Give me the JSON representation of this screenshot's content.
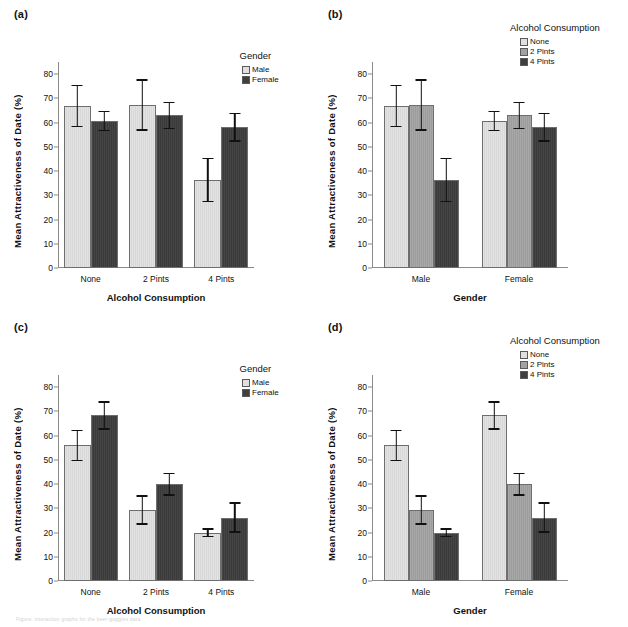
{
  "figure": {
    "caption_fragment": "Figure: interaction graphs for the beer-goggles data"
  },
  "axis": {
    "y_label": "Mean Attractiveness of Date (%)",
    "y_ticks": [
      "0",
      "10",
      "20",
      "30",
      "40",
      "50",
      "60",
      "70",
      "80"
    ],
    "y_min": 0,
    "y_max": 85
  },
  "colors": {
    "bar_none": "#dcdcdc",
    "bar_2pints": "#a2a2a2",
    "bar_4pints": "#3f3f3f",
    "bar_male": "#dcdcdc",
    "bar_female": "#3f3f3f",
    "axis": "#8a8a8a",
    "text": "#111111"
  },
  "panels": [
    {
      "id": "a",
      "label": "(a)",
      "x_label": "Alcohol Consumption",
      "legend_title": "Gender",
      "legend_items": [
        {
          "label": "Male",
          "key": "male"
        },
        {
          "label": "Female",
          "key": "female"
        }
      ]
    },
    {
      "id": "b",
      "label": "(b)",
      "x_label": "Gender",
      "legend_title": "Alcohol Consumption",
      "legend_items": [
        {
          "label": "None",
          "key": "none"
        },
        {
          "label": "2 Pints",
          "key": "two"
        },
        {
          "label": "4 Pints",
          "key": "four"
        }
      ]
    },
    {
      "id": "c",
      "label": "(c)",
      "x_label": "Alcohol Consumption",
      "legend_title": "Gender",
      "legend_items": [
        {
          "label": "Male",
          "key": "male"
        },
        {
          "label": "Female",
          "key": "female"
        }
      ]
    },
    {
      "id": "d",
      "label": "(d)",
      "x_label": "Gender",
      "legend_title": "Alcohol Consumption",
      "legend_items": [
        {
          "label": "None",
          "key": "none"
        },
        {
          "label": "2 Pints",
          "key": "two"
        },
        {
          "label": "4 Pints",
          "key": "four"
        }
      ]
    }
  ],
  "chart_data": [
    {
      "panel": "a",
      "type": "bar",
      "title": "(a)",
      "xlabel": "Alcohol Consumption",
      "ylabel": "Mean Attractiveness of Date (%)",
      "ylim": [
        0,
        85
      ],
      "grid": false,
      "legend_title": "Gender",
      "legend_position": "top-right",
      "categories": [
        "None",
        "2 Pints",
        "4 Pints"
      ],
      "series": [
        {
          "name": "Male",
          "key": "male",
          "values": [
            67,
            67.3,
            36.3
          ],
          "err_low": [
            58.2,
            56.7,
            27.1
          ],
          "err_high": [
            75.7,
            77.8,
            45.4
          ]
        },
        {
          "name": "Female",
          "key": "female",
          "values": [
            60.8,
            63,
            58
          ],
          "err_low": [
            56.4,
            57.4,
            52.1
          ],
          "err_high": [
            65,
            68.5,
            64
          ]
        }
      ]
    },
    {
      "panel": "b",
      "type": "bar",
      "title": "(b)",
      "xlabel": "Gender",
      "ylabel": "Mean Attractiveness of Date (%)",
      "ylim": [
        0,
        85
      ],
      "grid": false,
      "legend_title": "Alcohol Consumption",
      "legend_position": "top-right",
      "categories": [
        "Male",
        "Female"
      ],
      "series": [
        {
          "name": "None",
          "key": "none",
          "values": [
            67,
            60.8
          ],
          "err_low": [
            58.2,
            56.4
          ],
          "err_high": [
            75.7,
            65
          ]
        },
        {
          "name": "2 Pints",
          "key": "two",
          "values": [
            67.3,
            63
          ],
          "err_low": [
            56.7,
            57.4
          ],
          "err_high": [
            77.8,
            68.5
          ]
        },
        {
          "name": "4 Pints",
          "key": "four",
          "values": [
            36.3,
            58
          ],
          "err_low": [
            27.1,
            52.1
          ],
          "err_high": [
            45.4,
            64
          ]
        }
      ]
    },
    {
      "panel": "c",
      "type": "bar",
      "title": "(c)",
      "xlabel": "Alcohol Consumption",
      "ylabel": "Mean Attractiveness of Date (%)",
      "ylim": [
        0,
        85
      ],
      "grid": false,
      "legend_title": "Gender",
      "legend_position": "top-right",
      "categories": [
        "None",
        "2 Pints",
        "4 Pints"
      ],
      "series": [
        {
          "name": "Male",
          "key": "male",
          "values": [
            56,
            29.2,
            19.9
          ],
          "err_low": [
            49.5,
            23.2,
            18
          ],
          "err_high": [
            62.4,
            35.3,
            21.8
          ]
        },
        {
          "name": "Female",
          "key": "female",
          "values": [
            68.4,
            40,
            26.2
          ],
          "err_low": [
            62.5,
            35.2,
            20
          ],
          "err_high": [
            74.2,
            44.6,
            32.5
          ]
        }
      ]
    },
    {
      "panel": "d",
      "type": "bar",
      "title": "(d)",
      "xlabel": "Gender",
      "ylabel": "Mean Attractiveness of Date (%)",
      "ylim": [
        0,
        85
      ],
      "grid": false,
      "legend_title": "Alcohol Consumption",
      "legend_position": "top-right",
      "categories": [
        "Male",
        "Female"
      ],
      "series": [
        {
          "name": "None",
          "key": "none",
          "values": [
            56,
            68.4
          ],
          "err_low": [
            49.5,
            62.5
          ],
          "err_high": [
            62.4,
            74.2
          ]
        },
        {
          "name": "2 Pints",
          "key": "two",
          "values": [
            29.2,
            40
          ],
          "err_low": [
            23.2,
            35.2
          ],
          "err_high": [
            35.3,
            44.6
          ]
        },
        {
          "name": "4 Pints",
          "key": "four",
          "values": [
            19.9,
            26.2
          ],
          "err_low": [
            18,
            20
          ],
          "err_high": [
            21.8,
            32.5
          ]
        }
      ]
    }
  ]
}
